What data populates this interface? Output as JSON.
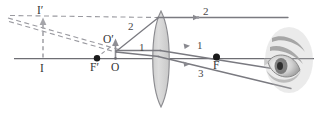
{
  "figure": {
    "kind": "optics-ray-diagram",
    "canvas": {
      "width": 314,
      "height": 117
    },
    "colors": {
      "axis": "#6e6e73",
      "ray": "#7a7a80",
      "dashed": "#9a9aa0",
      "lens_fill": "#d6d6d6",
      "lens_stroke": "#8c8c90",
      "point": "#1a1a1a",
      "label": "#3a3a3a",
      "eye": "#8a8a8a"
    }
  },
  "labels": {
    "image_top": {
      "text": "I′",
      "x": 38,
      "y": 6
    },
    "image_base": {
      "text": "I",
      "x": 38,
      "y": 64
    },
    "object_top": {
      "text": "O′",
      "x": 106,
      "y": 36
    },
    "object_base": {
      "text": "O",
      "x": 112,
      "y": 62
    },
    "focal_near": {
      "text": "F′",
      "x": 91,
      "y": 62
    },
    "focal_far": {
      "text": "F",
      "x": 213,
      "y": 60
    },
    "ray_one_left": {
      "text": "1",
      "x": 139,
      "y": 44
    },
    "ray_one_right": {
      "text": "1",
      "x": 197,
      "y": 41
    },
    "ray_two_left": {
      "text": "2",
      "x": 128,
      "y": 22
    },
    "ray_two_right": {
      "text": "2",
      "x": 204,
      "y": 8
    },
    "ray_three": {
      "text": "3",
      "x": 199,
      "y": 69
    }
  },
  "geometry": {
    "principal_axis": {
      "x1": 14,
      "y1": 58.5,
      "x2": 314,
      "y2": 58.5
    },
    "lens": {
      "center_x": 161,
      "top_y": 11,
      "bottom_y": 107,
      "bulge": 11
    },
    "object_arrow": {
      "x": 115,
      "y_base": 58,
      "y_tip": 40
    },
    "image_arrow": {
      "x": 43,
      "y_base": 58,
      "y_tip": 20
    },
    "points": [
      {
        "name": "focal-near",
        "x": 97,
        "y": 58.5,
        "r": 3.1
      },
      {
        "name": "focal-far",
        "x": 216,
        "y": 57.0,
        "r": 3.4
      }
    ],
    "rays_solid": [
      {
        "name": "ray-2-incident",
        "x1": 116,
        "y1": 52,
        "x2": 158,
        "y2": 17
      },
      {
        "name": "ray-2-refracted",
        "x1": 158,
        "y1": 17,
        "x2": 286,
        "y2": 17
      },
      {
        "name": "ray-1-incident",
        "x1": 116,
        "y1": 51,
        "x2": 161,
        "y2": 51
      },
      {
        "name": "ray-1-refracted",
        "x1": 161,
        "y1": 51,
        "x2": 290,
        "y2": 72
      },
      {
        "name": "ray-3-incident",
        "x1": 116,
        "y1": 50,
        "x2": 159,
        "y2": 57
      },
      {
        "name": "ray-3-refracted",
        "x1": 159,
        "y1": 57,
        "x2": 290,
        "y2": 89
      }
    ],
    "rays_dashed": [
      {
        "name": "virtual-extension-upper",
        "x1": 10,
        "y1": 15,
        "x2": 158,
        "y2": 17
      },
      {
        "name": "virtual-extension-ray1",
        "x1": 8,
        "y1": 18,
        "x2": 118,
        "y2": 50
      },
      {
        "name": "virtual-extension-ray3",
        "x1": 9,
        "y1": 21,
        "x2": 116,
        "y2": 52
      },
      {
        "name": "construction-focal",
        "x1": 97,
        "y1": 58.5,
        "x2": 118,
        "y2": 42
      }
    ]
  },
  "arrow_markers": {
    "ray_1_tip": {
      "x": 186,
      "y": 46
    },
    "ray_2_tip": {
      "x": 196,
      "y": 17
    },
    "ray_3_tip": {
      "x": 185,
      "y": 62
    }
  }
}
